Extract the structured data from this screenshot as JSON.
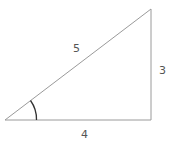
{
  "diagram": {
    "type": "right-triangle",
    "labels": {
      "hypotenuse": "5",
      "vertical_side": "3",
      "base": "4"
    },
    "colors": {
      "line": "#9a9a9a",
      "arc": "#333333",
      "text": "#555555"
    }
  }
}
